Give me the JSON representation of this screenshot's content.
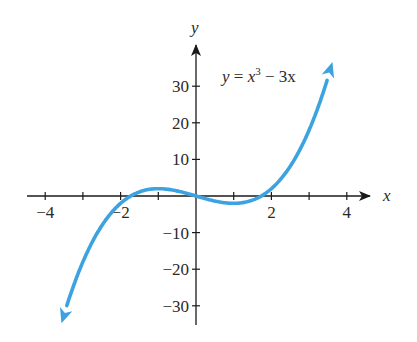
{
  "chart_data": {
    "type": "line",
    "title": "",
    "equation_label": {
      "lhs": "y",
      "eq": " = ",
      "base": "x",
      "exp": "3",
      "rest": " − 3x"
    },
    "xlabel": "x",
    "ylabel": "y",
    "xlim": [
      -4.5,
      4.5
    ],
    "ylim": [
      -35,
      40
    ],
    "x_ticks": [
      -4,
      -3,
      -2,
      -1,
      0,
      1,
      2,
      3,
      4
    ],
    "x_tick_labels": [
      {
        "value": -4,
        "label": "−4"
      },
      {
        "value": -2,
        "label": "−2"
      },
      {
        "value": 2,
        "label": "2"
      },
      {
        "value": 4,
        "label": "4"
      }
    ],
    "y_ticks": [
      -30,
      -20,
      -10,
      10,
      20,
      30
    ],
    "y_tick_labels": [
      {
        "value": 30,
        "label": "30"
      },
      {
        "value": 20,
        "label": "20"
      },
      {
        "value": 10,
        "label": "10"
      },
      {
        "value": -10,
        "label": "−10"
      },
      {
        "value": -20,
        "label": "−20"
      },
      {
        "value": -30,
        "label": "−30"
      }
    ],
    "grid": false,
    "legend": null,
    "series": [
      {
        "name": "y = x^3 - 3x",
        "function": "x^3 - 3x",
        "color": "#3da3e0",
        "x_range": [
          -3.57,
          3.62
        ],
        "arrows_at_ends": true,
        "x": [
          -3.5,
          -3,
          -2,
          -1.73,
          -1,
          0,
          1,
          1.73,
          2,
          3,
          3.5
        ],
        "values": [
          -32.4,
          -18,
          -2,
          0,
          2,
          0,
          -2,
          0,
          2,
          18,
          32.4
        ]
      }
    ],
    "key_points": [
      {
        "name": "local max",
        "x": -1,
        "y": 2
      },
      {
        "name": "local min",
        "x": 1,
        "y": -2
      },
      {
        "name": "root",
        "x": -1.732,
        "y": 0
      },
      {
        "name": "root",
        "x": 0,
        "y": 0
      },
      {
        "name": "root",
        "x": 1.732,
        "y": 0
      }
    ]
  },
  "style": {
    "curve_color": "#3da3e0",
    "axis_color": "#1a1a1a"
  }
}
